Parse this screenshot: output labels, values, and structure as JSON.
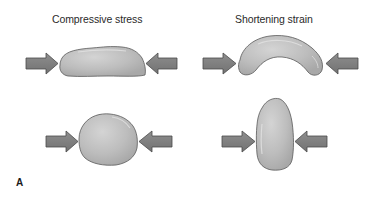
{
  "figure": {
    "panel_label": "A",
    "columns": [
      {
        "heading": "Compressive stress",
        "shapes": [
          "flattened-blob",
          "round-blob"
        ]
      },
      {
        "heading": "Shortening strain",
        "shapes": [
          "arched-blob",
          "tall-blob"
        ]
      }
    ],
    "colors": {
      "shape_fill": "#b9b9b9",
      "shape_highlight": "#d6d6d6",
      "shape_stroke": "#5a5a5a",
      "arrow_fill": "#7e7e7e",
      "arrow_stroke": "#4a4a4a",
      "text": "#2a2a2a"
    }
  }
}
